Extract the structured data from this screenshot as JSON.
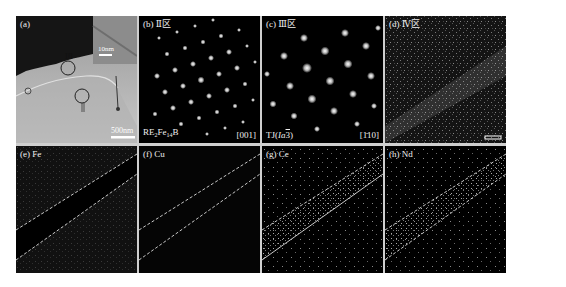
{
  "figure": {
    "panels": [
      {
        "id": "a",
        "label": "(a)",
        "type": "TEM bright-field image",
        "inset_scale": "10nm",
        "scale_bar": "500nm",
        "markers": [
          {
            "text": "III"
          },
          {
            "text": "II"
          }
        ]
      },
      {
        "id": "b",
        "label": "(b) Ⅱ区",
        "type": "SAED pattern",
        "phase": {
          "prefix": "RE",
          "s1": "2",
          "mid": "Fe",
          "s2": "14",
          "suffix": "B"
        },
        "zone_axis": "[001]"
      },
      {
        "id": "c",
        "label": "(c) Ⅲ区",
        "type": "SAED pattern",
        "phase": {
          "prefix": "TJ(",
          "ital": "Ia",
          "bar": "3",
          "suffix": ")"
        },
        "zone_axis": "[1̄10]"
      },
      {
        "id": "d",
        "label": "(d) Ⅳ区",
        "type": "EDS map"
      },
      {
        "id": "e",
        "label": "(e) Fe",
        "type": "EDS element map",
        "element": "Fe"
      },
      {
        "id": "f",
        "label": "(f) Cu",
        "type": "EDS element map",
        "element": "Cu"
      },
      {
        "id": "g",
        "label": "(g) Ce",
        "type": "EDS element map",
        "element": "Ce"
      },
      {
        "id": "h",
        "label": "(h) Nd",
        "type": "EDS element map",
        "element": "Nd"
      }
    ]
  }
}
